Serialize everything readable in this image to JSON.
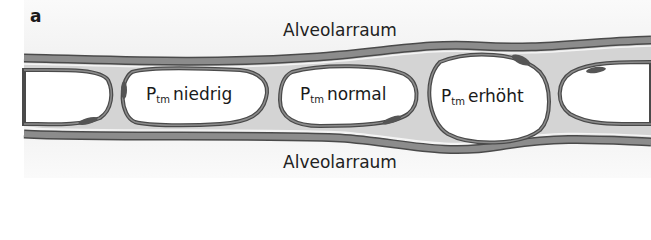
{
  "panel": {
    "label": "a"
  },
  "labels": {
    "top_space": "Alveolarraum",
    "bottom_space": "Alveolarraum"
  },
  "capillaries": [
    {
      "symbol": "P",
      "subscript": "tm",
      "state": "niedrig"
    },
    {
      "symbol": "P",
      "subscript": "tm",
      "state": "normal"
    },
    {
      "symbol": "P",
      "subscript": "tm",
      "state": "erhöht"
    }
  ],
  "colors": {
    "wall_band": "#8c8c8c",
    "wall_dark": "#4a4a4a",
    "interstitium": "#d4d4d4",
    "lumen": "#ffffff",
    "background": "#f0f0f0",
    "nucleus": "#555555"
  }
}
